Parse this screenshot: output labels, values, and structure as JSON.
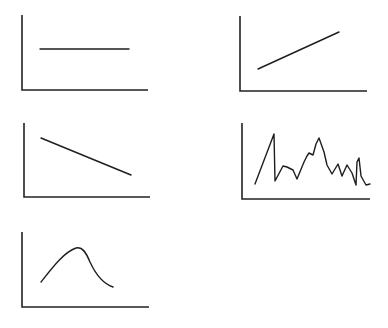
{
  "colors": {
    "background": "#ffffff",
    "axis": "#222222",
    "line": "#1e1e1e"
  },
  "chart_data": [
    {
      "id": "constant",
      "type": "line",
      "title": "",
      "xlabel": "",
      "ylabel": "",
      "axes": {
        "x0": 22,
        "y0": 90,
        "x1": 148,
        "ytop": 15
      },
      "x": [
        0,
        1
      ],
      "values": [
        0.55,
        0.55
      ],
      "points": [
        [
          40,
          49
        ],
        [
          129,
          49
        ]
      ],
      "smooth": false
    },
    {
      "id": "increasing",
      "type": "line",
      "title": "",
      "xlabel": "",
      "ylabel": "",
      "axes": {
        "x0": 240,
        "y0": 91,
        "x1": 367,
        "ytop": 16
      },
      "x": [
        0,
        1
      ],
      "values": [
        0.3,
        0.8
      ],
      "points": [
        [
          258,
          69
        ],
        [
          339,
          32
        ]
      ],
      "smooth": false
    },
    {
      "id": "decreasing",
      "type": "line",
      "title": "",
      "xlabel": "",
      "ylabel": "",
      "axes": {
        "x0": 24,
        "y0": 197,
        "x1": 150,
        "ytop": 123
      },
      "x": [
        0,
        1
      ],
      "values": [
        0.8,
        0.3
      ],
      "points": [
        [
          41,
          138
        ],
        [
          131,
          175
        ]
      ],
      "smooth": false
    },
    {
      "id": "fluctuating",
      "type": "line",
      "title": "",
      "xlabel": "",
      "ylabel": "",
      "axes": {
        "x0": 242,
        "y0": 199,
        "x1": 370,
        "ytop": 123
      },
      "points": [
        [
          255,
          184
        ],
        [
          274,
          134
        ],
        [
          275,
          181
        ],
        [
          283,
          166
        ],
        [
          287,
          167
        ],
        [
          293,
          170
        ],
        [
          297,
          179
        ],
        [
          304,
          162
        ],
        [
          307,
          156
        ],
        [
          309,
          153
        ],
        [
          313,
          155
        ],
        [
          316,
          144
        ],
        [
          319,
          138
        ],
        [
          324,
          152
        ],
        [
          327,
          165
        ],
        [
          332,
          174
        ],
        [
          338,
          164
        ],
        [
          342,
          176
        ],
        [
          347,
          165
        ],
        [
          352,
          173
        ],
        [
          356,
          185
        ],
        [
          357,
          162
        ],
        [
          359,
          158
        ],
        [
          361,
          176
        ],
        [
          366,
          185
        ],
        [
          370,
          184
        ]
      ],
      "smooth": false
    },
    {
      "id": "peak",
      "type": "line",
      "title": "",
      "xlabel": "",
      "ylabel": "",
      "axes": {
        "x0": 22,
        "y0": 307,
        "x1": 149,
        "ytop": 232
      },
      "path": "M41 282 C 52 268, 64 252, 76 248 C 82 246, 86 252, 90 262 C 96 275, 104 284, 113 287",
      "smooth": true
    }
  ]
}
